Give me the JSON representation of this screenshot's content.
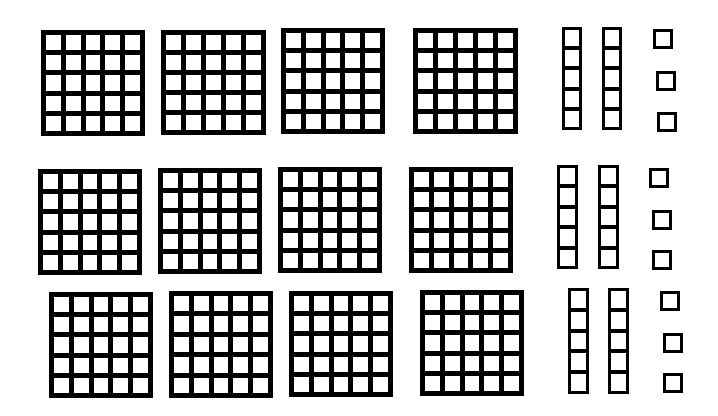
{
  "diagram": {
    "colors": {
      "line": "#000000",
      "fill": "#ffffff",
      "background": "#ffffff"
    },
    "rows": [
      {
        "grids": [
          {
            "x": 41,
            "y": 30,
            "w": 104,
            "h": 106,
            "cols": 5,
            "rows": 5
          },
          {
            "x": 161,
            "y": 30,
            "w": 105,
            "h": 105,
            "cols": 5,
            "rows": 5
          },
          {
            "x": 281,
            "y": 28,
            "w": 104,
            "h": 106,
            "cols": 5,
            "rows": 5
          },
          {
            "x": 413,
            "y": 28,
            "w": 105,
            "h": 106,
            "cols": 5,
            "rows": 5
          }
        ],
        "rods": [
          {
            "x": 562,
            "y": 27,
            "w": 20,
            "h": 103,
            "units": 5
          },
          {
            "x": 602,
            "y": 27,
            "w": 20,
            "h": 103,
            "units": 5
          }
        ],
        "units": [
          {
            "x": 653,
            "y": 29,
            "s": 20
          },
          {
            "x": 656,
            "y": 71,
            "s": 20
          },
          {
            "x": 657,
            "y": 112,
            "s": 20
          }
        ]
      },
      {
        "grids": [
          {
            "x": 38,
            "y": 169,
            "w": 104,
            "h": 106,
            "cols": 5,
            "rows": 5
          },
          {
            "x": 158,
            "y": 168,
            "w": 104,
            "h": 106,
            "cols": 5,
            "rows": 5
          },
          {
            "x": 278,
            "y": 167,
            "w": 104,
            "h": 106,
            "cols": 5,
            "rows": 5
          },
          {
            "x": 409,
            "y": 167,
            "w": 104,
            "h": 106,
            "cols": 5,
            "rows": 5
          }
        ],
        "rods": [
          {
            "x": 557,
            "y": 165,
            "w": 21,
            "h": 104,
            "units": 5
          },
          {
            "x": 598,
            "y": 165,
            "w": 21,
            "h": 104,
            "units": 5
          }
        ],
        "units": [
          {
            "x": 649,
            "y": 168,
            "s": 20
          },
          {
            "x": 652,
            "y": 210,
            "s": 20
          },
          {
            "x": 652,
            "y": 250,
            "s": 20
          }
        ]
      },
      {
        "grids": [
          {
            "x": 49,
            "y": 292,
            "w": 104,
            "h": 106,
            "cols": 5,
            "rows": 5
          },
          {
            "x": 169,
            "y": 291,
            "w": 104,
            "h": 107,
            "cols": 5,
            "rows": 5
          },
          {
            "x": 289,
            "y": 291,
            "w": 104,
            "h": 106,
            "cols": 5,
            "rows": 5
          },
          {
            "x": 420,
            "y": 290,
            "w": 104,
            "h": 106,
            "cols": 5,
            "rows": 5
          }
        ],
        "rods": [
          {
            "x": 568,
            "y": 288,
            "w": 21,
            "h": 106,
            "units": 5
          },
          {
            "x": 608,
            "y": 288,
            "w": 21,
            "h": 106,
            "units": 5
          }
        ],
        "units": [
          {
            "x": 660,
            "y": 291,
            "s": 20
          },
          {
            "x": 663,
            "y": 333,
            "s": 20
          },
          {
            "x": 663,
            "y": 373,
            "s": 20
          }
        ]
      }
    ],
    "totals": {
      "grids": 12,
      "rods": 6,
      "units": 9
    }
  }
}
